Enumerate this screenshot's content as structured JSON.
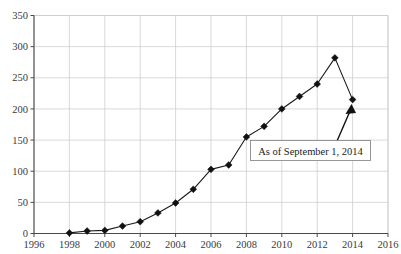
{
  "chart_data": {
    "type": "line",
    "title": "",
    "subtitle": "",
    "xlabel": "",
    "ylabel": "",
    "xlim": [
      1996,
      2016
    ],
    "ylim": [
      0,
      350
    ],
    "grid": true,
    "legend": "none",
    "x_ticks": [
      "1996",
      "1998",
      "2000",
      "2002",
      "2004",
      "2006",
      "2008",
      "2010",
      "2012",
      "2014",
      "2016"
    ],
    "y_ticks": [
      "0",
      "50",
      "100",
      "150",
      "200",
      "250",
      "300",
      "350"
    ],
    "x": [
      1998,
      1999,
      2000,
      2001,
      2002,
      2003,
      2004,
      2005,
      2006,
      2007,
      2008,
      2009,
      2010,
      2011,
      2012,
      2013,
      2014
    ],
    "values": [
      1,
      4,
      5,
      12,
      19,
      33,
      49,
      71,
      103,
      110,
      155,
      172,
      200,
      220,
      240,
      282,
      215
    ],
    "series": [
      {
        "name": "",
        "marker": "diamond",
        "color": "#111111",
        "values": [
          1,
          4,
          5,
          12,
          19,
          33,
          49,
          71,
          103,
          110,
          155,
          172,
          200,
          220,
          240,
          282,
          215
        ]
      }
    ],
    "annotations": [
      {
        "text": "As of September 1, 2014",
        "points_to_x": 2014,
        "points_to_y": 215
      }
    ]
  },
  "annotation": {
    "label": "As of September 1, 2014"
  },
  "colors": {
    "series": "#111111",
    "grid": "#c9c9c9",
    "axis": "#4a4a4a",
    "text": "#3a3a3a",
    "background": "#ffffff",
    "annotation_border": "#8d8d8d"
  }
}
